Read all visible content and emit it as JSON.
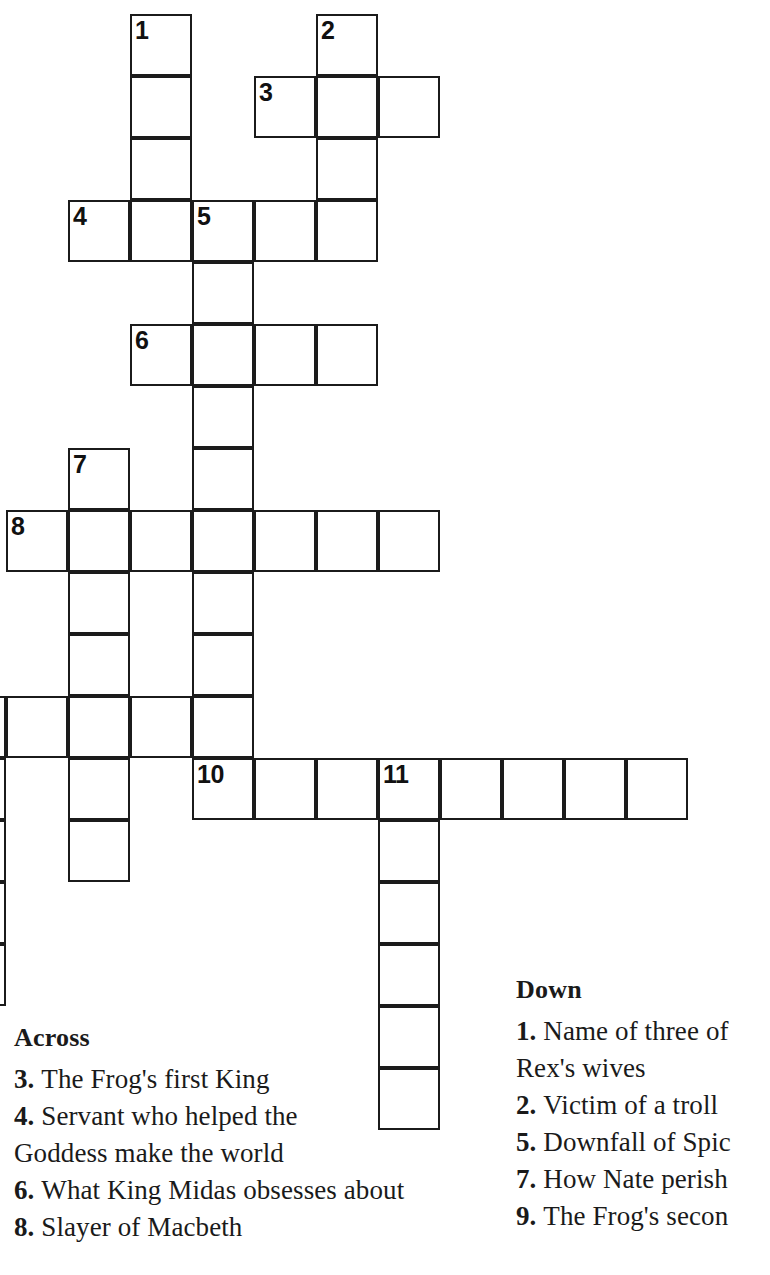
{
  "puzzle": {
    "grid": {
      "cell_size": 62,
      "origin_x": 6,
      "origin_y": 14,
      "border_color": "#1b1b1b",
      "cell_color": "#ffffff",
      "entries": [
        {
          "number": "1",
          "direction": "down",
          "row": 0,
          "col": 2,
          "length": 4
        },
        {
          "number": "2",
          "direction": "down",
          "row": 0,
          "col": 5,
          "length": 4
        },
        {
          "number": "3",
          "direction": "across",
          "row": 1,
          "col": 4,
          "length": 3
        },
        {
          "number": "4",
          "direction": "across",
          "row": 3,
          "col": 1,
          "length": 5
        },
        {
          "number": "5",
          "direction": "down",
          "row": 3,
          "col": 3,
          "length": 9
        },
        {
          "number": "6",
          "direction": "across",
          "row": 5,
          "col": 2,
          "length": 4
        },
        {
          "number": "7",
          "direction": "down",
          "row": 7,
          "col": 1,
          "length": 7
        },
        {
          "number": "8",
          "direction": "across",
          "row": 8,
          "col": 0,
          "length": 7
        },
        {
          "number": "9",
          "direction": "across",
          "row": 11,
          "col": -1,
          "length": 5
        },
        {
          "number": "9",
          "direction": "down",
          "row": 11,
          "col": -1,
          "length": 5
        },
        {
          "number": "10",
          "direction": "across",
          "row": 12,
          "col": 3,
          "length": 8
        },
        {
          "number": "11",
          "direction": "down",
          "row": 12,
          "col": 6,
          "length": 6
        }
      ]
    },
    "across": {
      "heading": "Across",
      "clues": [
        {
          "number": "3.",
          "lines": [
            "The Frog's first King"
          ]
        },
        {
          "number": "4.",
          "lines": [
            "Servant who helped the",
            "Goddess make the world"
          ]
        },
        {
          "number": "6.",
          "lines": [
            "What King Midas obsesses about"
          ]
        },
        {
          "number": "8.",
          "lines": [
            "Slayer of Macbeth"
          ]
        }
      ]
    },
    "down": {
      "heading": "Down",
      "clues": [
        {
          "number": "1.",
          "lines": [
            "Name of three of",
            "Rex's wives"
          ]
        },
        {
          "number": "2.",
          "lines": [
            "Victim of a troll"
          ]
        },
        {
          "number": "5.",
          "lines": [
            "Downfall of Spic"
          ]
        },
        {
          "number": "7.",
          "lines": [
            "How Nate perish"
          ]
        },
        {
          "number": "9.",
          "lines": [
            "The Frog's secon"
          ]
        }
      ]
    }
  }
}
